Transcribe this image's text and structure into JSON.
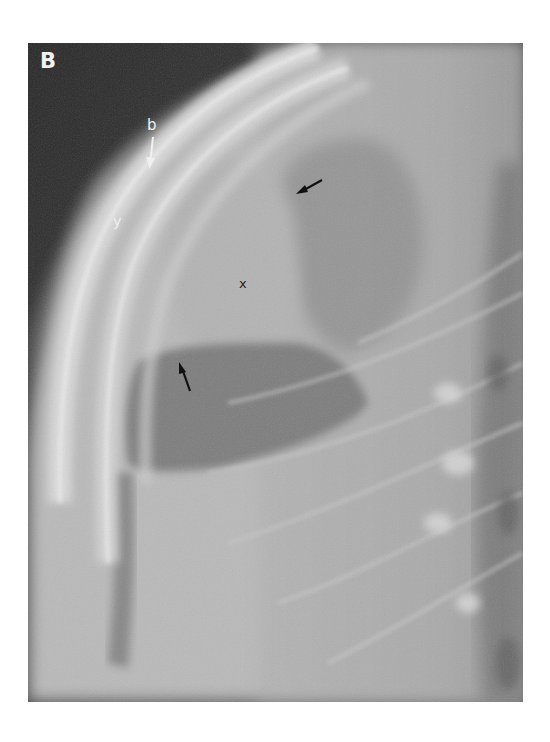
{
  "figure": {
    "panel_letter": "B",
    "labels": {
      "b": "b",
      "y": "y",
      "x": "x"
    },
    "arrows": [
      {
        "name": "white-arrow-b",
        "color": "#f0f0f0",
        "points_to": "b"
      },
      {
        "name": "black-arrow-upper",
        "color": "#111111"
      },
      {
        "name": "black-arrow-lower",
        "color": "#111111"
      }
    ],
    "colors": {
      "background_dark": "#2a2a2a",
      "soft_tissue": "#6e6e6e",
      "bone_light": "#e6e6e6",
      "lung_gray": "#8d8d8d"
    }
  }
}
